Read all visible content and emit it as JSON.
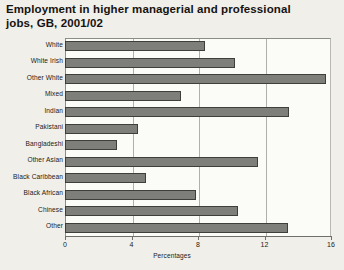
{
  "chart_data": {
    "type": "bar",
    "orientation": "horizontal",
    "title": "Employment in higher managerial and professional\njobs, GB, 2001/02",
    "xlabel": "Percentages",
    "ylabel": "",
    "xlim": [
      0,
      16
    ],
    "xticks": [
      0,
      4,
      8,
      12,
      16
    ],
    "xtick_labels": [
      "0",
      "4",
      "8",
      "12",
      "16"
    ],
    "grid": true,
    "legend": "none",
    "bar_color": "#7e7e7a",
    "bar_border_color": "#3e3e3b",
    "plot_background": "#fbfbf8",
    "page_background": "#f0efea",
    "categories": [
      "White",
      "White Irish",
      "Other White",
      "Mixed",
      "Indian",
      "Pakistani",
      "Bangladeshi",
      "Other Asian",
      "Black Caribbean",
      "Black African",
      "Chinese",
      "Other"
    ],
    "values": [
      8.4,
      10.2,
      15.7,
      7.0,
      13.5,
      4.4,
      3.1,
      11.6,
      4.9,
      7.9,
      10.4,
      13.4
    ]
  }
}
